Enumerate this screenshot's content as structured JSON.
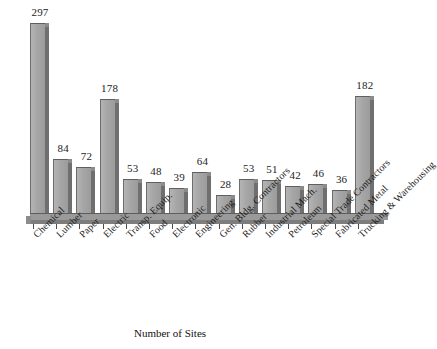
{
  "chart_data": {
    "type": "bar",
    "title": "",
    "xlabel": "Number of Sites",
    "ylabel": "",
    "ylim": [
      0,
      320
    ],
    "grid": false,
    "legend": false,
    "orientation": "vertical",
    "value_labels_shown": true,
    "categories": [
      "Chemical",
      "Lumber",
      "Paper",
      "Electric",
      "Transp. Equip.",
      "Food",
      "Electronic",
      "Engineering",
      "Gen. Bldg. Contractors",
      "Rubber",
      "Industrial Mach.",
      "Petroleum",
      "Special Trade Contractors",
      "Fabricated Metal",
      "Trucking & Warehousing"
    ],
    "values": [
      297,
      84,
      72,
      178,
      53,
      48,
      39,
      64,
      28,
      53,
      51,
      42,
      46,
      36,
      182
    ],
    "bar_color": "#a6a6a6",
    "bar_shadow_color": "#6f6f6f",
    "axis_color": "#4a4a4a",
    "background": "#ffffff"
  },
  "figure": {
    "x_axis_title": "Number of Sites"
  }
}
